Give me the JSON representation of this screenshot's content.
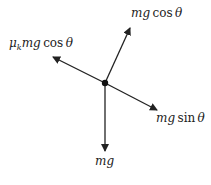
{
  "diagram": {
    "center": {
      "x": 105,
      "y": 83
    },
    "forces": [
      {
        "id": "normal",
        "label_var": "mg",
        "label_fn": "cos",
        "label_angle": "θ",
        "tip": {
          "x": 130,
          "y": 28
        }
      },
      {
        "id": "friction",
        "label_coef": "μ",
        "label_sub": "k",
        "label_var": "mg",
        "label_fn": "cos",
        "label_angle": "θ",
        "tip": {
          "x": 53,
          "y": 57
        }
      },
      {
        "id": "parallel",
        "label_var": "mg",
        "label_fn": "sin",
        "label_angle": "θ",
        "tip": {
          "x": 157,
          "y": 110
        }
      },
      {
        "id": "weight",
        "label_var": "mg",
        "tip": {
          "x": 105,
          "y": 151
        }
      }
    ],
    "colors": {
      "stroke": "#222222"
    }
  }
}
